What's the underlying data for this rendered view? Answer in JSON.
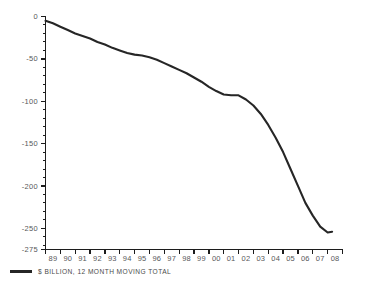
{
  "chart_data": {
    "type": "line",
    "title": "",
    "subtitle": "",
    "xlabel": "",
    "ylabel": "",
    "ylim": [
      -275,
      0
    ],
    "yticks": [
      0,
      -50,
      -100,
      -150,
      -200,
      -250,
      -275
    ],
    "ytick_labels": [
      "0",
      "-50",
      "-100",
      "-150",
      "-200",
      "-250",
      "-275"
    ],
    "minor_ytick_step": 10,
    "grid": false,
    "legend_position": "bottom-left",
    "categories": [
      "89",
      "90",
      "91",
      "92",
      "93",
      "94",
      "95",
      "96",
      "97",
      "98",
      "99",
      "00",
      "01",
      "02",
      "03",
      "04",
      "05",
      "06",
      "07",
      "08"
    ],
    "series": [
      {
        "name": "$ BILLION, 12 MONTH MOVING TOTAL",
        "color": "#262626",
        "values": [
          -5,
          -12,
          -20,
          -26,
          -33,
          -40,
          -45,
          -48,
          -55,
          -63,
          -72,
          -83,
          -92,
          -93,
          -105,
          -128,
          -160,
          -200,
          -235,
          -255
        ]
      }
    ],
    "points": [
      {
        "x": "89.0",
        "y": -5
      },
      {
        "x": "89.5",
        "y": -8
      },
      {
        "x": "90.0",
        "y": -12
      },
      {
        "x": "90.5",
        "y": -16
      },
      {
        "x": "91.0",
        "y": -20
      },
      {
        "x": "91.5",
        "y": -23
      },
      {
        "x": "92.0",
        "y": -26
      },
      {
        "x": "92.5",
        "y": -30
      },
      {
        "x": "93.0",
        "y": -33
      },
      {
        "x": "93.5",
        "y": -37
      },
      {
        "x": "94.0",
        "y": -40
      },
      {
        "x": "94.5",
        "y": -43
      },
      {
        "x": "95.0",
        "y": -45
      },
      {
        "x": "95.5",
        "y": -46
      },
      {
        "x": "96.0",
        "y": -48
      },
      {
        "x": "96.5",
        "y": -51
      },
      {
        "x": "97.0",
        "y": -55
      },
      {
        "x": "97.5",
        "y": -59
      },
      {
        "x": "98.0",
        "y": -63
      },
      {
        "x": "98.5",
        "y": -67
      },
      {
        "x": "99.0",
        "y": -72
      },
      {
        "x": "99.5",
        "y": -77
      },
      {
        "x": "00.0",
        "y": -83
      },
      {
        "x": "00.5",
        "y": -88
      },
      {
        "x": "01.0",
        "y": -92
      },
      {
        "x": "01.5",
        "y": -93
      },
      {
        "x": "02.0",
        "y": -93
      },
      {
        "x": "02.5",
        "y": -98
      },
      {
        "x": "03.0",
        "y": -105
      },
      {
        "x": "03.5",
        "y": -115
      },
      {
        "x": "04.0",
        "y": -128
      },
      {
        "x": "04.5",
        "y": -143
      },
      {
        "x": "05.0",
        "y": -160
      },
      {
        "x": "05.5",
        "y": -180
      },
      {
        "x": "06.0",
        "y": -200
      },
      {
        "x": "06.5",
        "y": -220
      },
      {
        "x": "07.0",
        "y": -235
      },
      {
        "x": "07.5",
        "y": -248
      },
      {
        "x": "08.0",
        "y": -255
      },
      {
        "x": "08.3",
        "y": -254
      }
    ]
  },
  "legend": {
    "label": "$ BILLION, 12 MONTH MOVING TOTAL",
    "swatch_color": "#262626"
  },
  "axes": {
    "axis_color": "#1c1c1c",
    "label_color": "#58585a"
  }
}
